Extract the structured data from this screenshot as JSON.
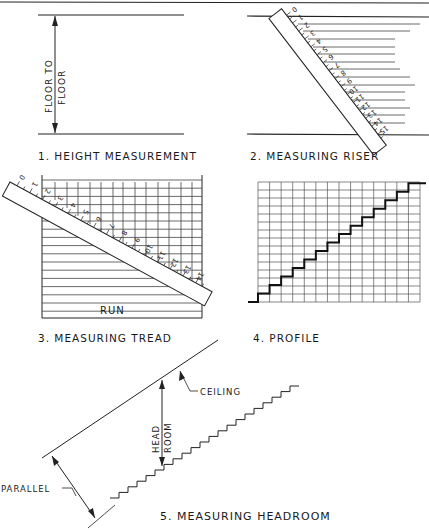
{
  "header": {
    "text": "...OF HANDRAILS AND GU..."
  },
  "panels": [
    {
      "id": 1,
      "caption": "1. HEIGHT MEASUREMENT",
      "dimension_label_line1": "FLOOR TO",
      "dimension_label_line2": "FLOOR"
    },
    {
      "id": 2,
      "caption": "2. MEASURING RISER",
      "ruler_ticks": [
        "0",
        "1",
        "2",
        "3",
        "4",
        "5",
        "6",
        "7",
        "8",
        "9",
        "10",
        "11",
        "12",
        "13",
        "14",
        "15"
      ]
    },
    {
      "id": 3,
      "caption": "3. MEASURING TREAD",
      "run_label": "RUN",
      "ruler_ticks": [
        "0",
        "1",
        "2",
        "3",
        "4",
        "5",
        "6",
        "7",
        "8",
        "9",
        "10",
        "11",
        "12",
        "13",
        "14"
      ]
    },
    {
      "id": 4,
      "caption": "4. PROFILE",
      "grid_columns": 14,
      "grid_rows": 15,
      "steps": 14
    },
    {
      "id": 5,
      "caption": "5. MEASURING HEADROOM",
      "ceiling_label": "CEILING",
      "headroom_line1": "HEAD",
      "headroom_line2": "ROOM",
      "parallel_label": "PARALLEL"
    }
  ],
  "colors": {
    "ink": "#222222",
    "paper": "#ffffff"
  }
}
